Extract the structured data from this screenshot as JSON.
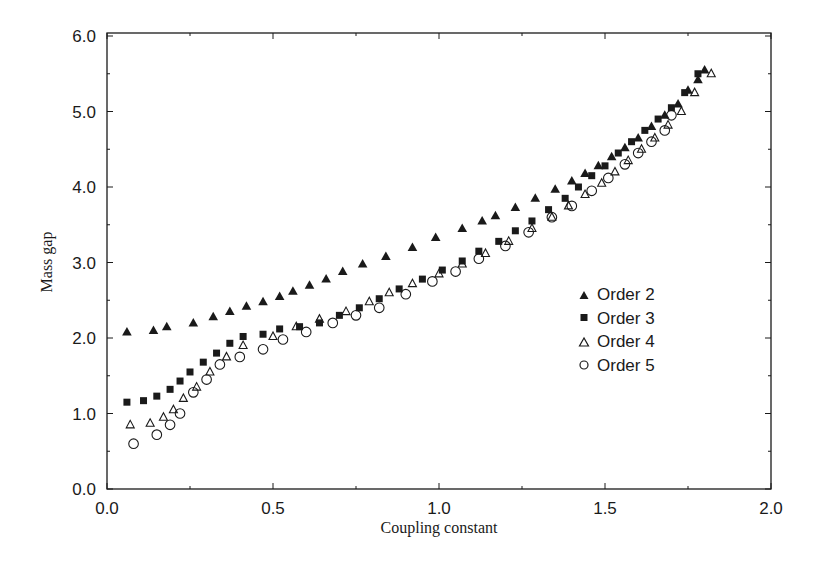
{
  "chart_data": {
    "type": "scatter",
    "title": "",
    "xlabel": "Coupling constant",
    "ylabel": "Mass gap",
    "xlim": [
      0.0,
      2.0
    ],
    "ylim": [
      0.0,
      6.0
    ],
    "xticks": [
      "0.0",
      "0.5",
      "1.0",
      "1.5",
      "2.0"
    ],
    "yticks": [
      "0.0",
      "1.0",
      "2.0",
      "3.0",
      "4.0",
      "5.0",
      "6.0"
    ],
    "grid": false,
    "legend_position": "center-right",
    "series": [
      {
        "name": "Order 2",
        "marker": "filled-triangle",
        "x": [
          0.06,
          0.14,
          0.18,
          0.26,
          0.32,
          0.37,
          0.42,
          0.47,
          0.52,
          0.56,
          0.61,
          0.66,
          0.71,
          0.77,
          0.84,
          0.92,
          0.99,
          1.07,
          1.13,
          1.17,
          1.23,
          1.29,
          1.35,
          1.4,
          1.44,
          1.48,
          1.52,
          1.56,
          1.6,
          1.64,
          1.68,
          1.72,
          1.75,
          1.78,
          1.8
        ],
        "y": [
          2.08,
          2.1,
          2.15,
          2.2,
          2.28,
          2.35,
          2.42,
          2.48,
          2.55,
          2.62,
          2.7,
          2.78,
          2.88,
          2.98,
          3.08,
          3.2,
          3.33,
          3.45,
          3.55,
          3.62,
          3.73,
          3.85,
          3.97,
          4.08,
          4.18,
          4.28,
          4.4,
          4.52,
          4.65,
          4.8,
          4.95,
          5.1,
          5.28,
          5.42,
          5.55
        ]
      },
      {
        "name": "Order 3",
        "marker": "filled-square",
        "x": [
          0.06,
          0.11,
          0.15,
          0.19,
          0.22,
          0.25,
          0.29,
          0.33,
          0.37,
          0.41,
          0.47,
          0.52,
          0.58,
          0.64,
          0.7,
          0.76,
          0.82,
          0.88,
          0.95,
          1.01,
          1.07,
          1.12,
          1.18,
          1.23,
          1.28,
          1.33,
          1.38,
          1.42,
          1.46,
          1.5,
          1.54,
          1.58,
          1.62,
          1.66,
          1.7,
          1.74,
          1.78
        ],
        "y": [
          1.15,
          1.17,
          1.23,
          1.32,
          1.43,
          1.55,
          1.68,
          1.8,
          1.93,
          2.02,
          2.05,
          2.12,
          2.15,
          2.2,
          2.3,
          2.4,
          2.52,
          2.65,
          2.78,
          2.9,
          3.02,
          3.15,
          3.28,
          3.42,
          3.55,
          3.7,
          3.85,
          4.0,
          4.15,
          4.28,
          4.45,
          4.6,
          4.75,
          4.9,
          5.05,
          5.25,
          5.5
        ]
      },
      {
        "name": "Order 4",
        "marker": "open-triangle",
        "x": [
          0.07,
          0.13,
          0.17,
          0.2,
          0.23,
          0.27,
          0.31,
          0.36,
          0.41,
          0.5,
          0.57,
          0.64,
          0.72,
          0.79,
          0.85,
          0.92,
          1.0,
          1.07,
          1.14,
          1.21,
          1.28,
          1.34,
          1.39,
          1.44,
          1.49,
          1.53,
          1.57,
          1.61,
          1.65,
          1.69,
          1.73,
          1.77,
          1.82
        ],
        "y": [
          0.85,
          0.87,
          0.95,
          1.05,
          1.2,
          1.35,
          1.55,
          1.75,
          1.9,
          2.02,
          2.15,
          2.25,
          2.35,
          2.48,
          2.6,
          2.72,
          2.85,
          2.98,
          3.12,
          3.28,
          3.45,
          3.6,
          3.75,
          3.9,
          4.05,
          4.2,
          4.35,
          4.5,
          4.65,
          4.82,
          5.0,
          5.25,
          5.5
        ]
      },
      {
        "name": "Order 5",
        "marker": "open-circle",
        "x": [
          0.08,
          0.15,
          0.19,
          0.22,
          0.26,
          0.3,
          0.34,
          0.4,
          0.47,
          0.53,
          0.6,
          0.68,
          0.75,
          0.82,
          0.9,
          0.98,
          1.05,
          1.12,
          1.2,
          1.27,
          1.34,
          1.4,
          1.46,
          1.51,
          1.56,
          1.6,
          1.64,
          1.68,
          1.7
        ],
        "y": [
          0.6,
          0.72,
          0.85,
          1.0,
          1.28,
          1.45,
          1.65,
          1.75,
          1.85,
          1.98,
          2.08,
          2.2,
          2.3,
          2.4,
          2.58,
          2.75,
          2.88,
          3.05,
          3.22,
          3.4,
          3.6,
          3.75,
          3.95,
          4.12,
          4.3,
          4.45,
          4.6,
          4.75,
          4.95
        ]
      }
    ]
  },
  "legend": {
    "items": [
      {
        "label": "Order 2",
        "marker": "filled-triangle"
      },
      {
        "label": "Order 3",
        "marker": "filled-square"
      },
      {
        "label": "Order 4",
        "marker": "open-triangle"
      },
      {
        "label": "Order 5",
        "marker": "open-circle"
      }
    ]
  },
  "colors": {
    "ink": "#1a1a1a",
    "background": "#ffffff"
  }
}
